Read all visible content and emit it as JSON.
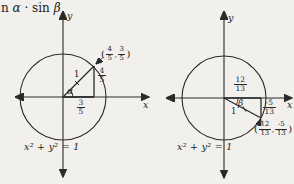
{
  "colors": {
    "background": "#f1f0ec",
    "ink": "#2a2a2a"
  },
  "top_caption": {
    "part1": "n ",
    "alpha": "α",
    "part2": " · sin ",
    "beta": "β"
  },
  "left_figure": {
    "x_axis_label": "x",
    "y_axis_label": "y",
    "radius_label": "1",
    "angle_label": "α",
    "vertical_leg_fraction": {
      "num": "4",
      "den": "5"
    },
    "horizontal_leg_fraction": {
      "num": "3",
      "den": "5"
    },
    "point_label": {
      "open_paren": "(",
      "x_num": "4",
      "x_den": "5",
      "comma": ",",
      "y_num": "3",
      "y_den": "5",
      "close_paren": ")"
    },
    "equation": "x² + y² = 1"
  },
  "right_figure": {
    "x_axis_label": "x",
    "y_axis_label": "y",
    "radius_label": "1",
    "angle_label": "β",
    "horizontal_leg_fraction": {
      "num": "12",
      "den": "13"
    },
    "vertical_leg_fraction": {
      "num": "-5",
      "den": "13"
    },
    "point_label": {
      "open_paren": "(",
      "x_num": "12",
      "x_den": "13",
      "comma": ",",
      "y_num": "-5",
      "y_den": "13",
      "close_paren": ")"
    },
    "equation": "x² + y² = 1"
  }
}
